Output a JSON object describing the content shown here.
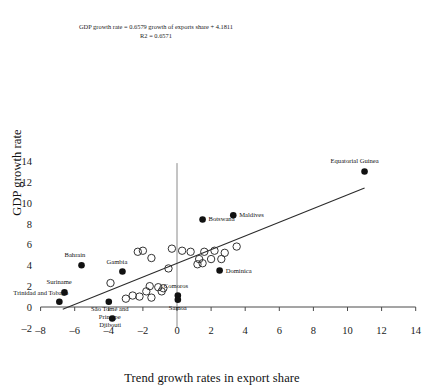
{
  "chart_data": {
    "type": "scatter",
    "title": "",
    "xlabel": "Trend growth rates in export share",
    "ylabel": "GDP growth rate",
    "xlim": [
      -8.8,
      14.8
    ],
    "ylim": [
      -2.6,
      14.6
    ],
    "xticks": [
      -8,
      -6,
      -4,
      -2,
      0,
      2,
      4,
      6,
      8,
      10,
      12,
      14
    ],
    "yticks": [
      -2,
      0,
      2,
      4,
      6,
      8,
      10,
      12,
      14
    ],
    "grid": false,
    "legend": "none",
    "annotations": {
      "equation": "GDP growth rate = 0.6579 growth of exports share + 4.1811",
      "r_squared": "R2 = 0.6571"
    },
    "trendline": {
      "slope": 0.6579,
      "intercept": 4.1811,
      "x_start": -6.7,
      "x_end": 11.0,
      "color": "#2b2b2b"
    },
    "series": [
      {
        "name": "labelled-countries",
        "marker": "filled-circle",
        "color": "#111111",
        "points": [
          {
            "label": "Equatorial Guinea",
            "x": 11.0,
            "y": 13.0,
            "label_pos": "above"
          },
          {
            "label": "Maldives",
            "x": 3.3,
            "y": 8.8,
            "label_pos": "right"
          },
          {
            "label": "Botswana",
            "x": 1.5,
            "y": 8.4,
            "label_pos": "right"
          },
          {
            "label": "Dominica",
            "x": 2.5,
            "y": 3.5,
            "label_pos": "right"
          },
          {
            "label": "Bahrain",
            "x": -5.6,
            "y": 4.0,
            "label_pos": "above"
          },
          {
            "label": "Gambia",
            "x": -3.2,
            "y": 3.4,
            "label_pos": "above"
          },
          {
            "label": "Suriname",
            "x": -6.6,
            "y": 1.4,
            "label_pos": "above"
          },
          {
            "label": "Trinidad and Tobago",
            "x": -6.9,
            "y": 0.5,
            "label_pos": "above"
          },
          {
            "label": "São Tomé and Principe",
            "x": -4.0,
            "y": 0.5,
            "label_pos": "below"
          },
          {
            "label": "Comoros",
            "x": 0.05,
            "y": 1.1,
            "label_pos": "above"
          },
          {
            "label": "Samoa",
            "x": 0.05,
            "y": 0.7,
            "label_pos": "below"
          },
          {
            "label": "Djibouti",
            "x": -3.8,
            "y": -1.1,
            "label_pos": "below"
          }
        ]
      },
      {
        "name": "other-countries",
        "marker": "open-circle",
        "color": "#333333",
        "points": [
          {
            "x": -2.3,
            "y": 5.3
          },
          {
            "x": -2.0,
            "y": 5.4
          },
          {
            "x": -0.3,
            "y": 5.6
          },
          {
            "x": 0.3,
            "y": 5.4
          },
          {
            "x": 0.8,
            "y": 5.3
          },
          {
            "x": 1.6,
            "y": 5.3
          },
          {
            "x": 2.2,
            "y": 5.4
          },
          {
            "x": 2.8,
            "y": 5.2
          },
          {
            "x": 3.5,
            "y": 5.8
          },
          {
            "x": -1.5,
            "y": 4.7
          },
          {
            "x": 1.3,
            "y": 4.6
          },
          {
            "x": 2.0,
            "y": 4.6
          },
          {
            "x": 2.6,
            "y": 4.6
          },
          {
            "x": 1.2,
            "y": 4.1
          },
          {
            "x": 1.5,
            "y": 4.2
          },
          {
            "x": -0.5,
            "y": 3.7
          },
          {
            "x": -3.9,
            "y": 2.3
          },
          {
            "x": -1.6,
            "y": 2.0
          },
          {
            "x": -1.1,
            "y": 1.9
          },
          {
            "x": -0.8,
            "y": 1.8
          },
          {
            "x": -1.8,
            "y": 1.5
          },
          {
            "x": -0.9,
            "y": 1.5
          },
          {
            "x": -2.6,
            "y": 1.1
          },
          {
            "x": -2.2,
            "y": 1.0
          },
          {
            "x": -1.5,
            "y": 0.9
          },
          {
            "x": -3.0,
            "y": 0.8
          }
        ]
      }
    ]
  }
}
